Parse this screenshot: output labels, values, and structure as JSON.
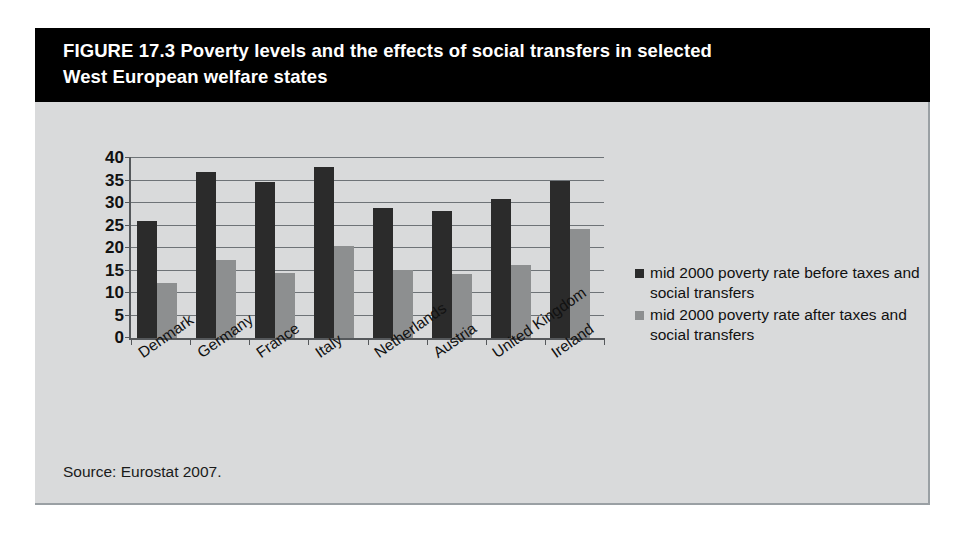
{
  "figure": {
    "title": "FIGURE 17.3  Poverty levels and the effects of social transfers in selected\nWest European welfare states",
    "source_note": "Source: Eurostat 2007.",
    "title_bg": "#000000",
    "title_color": "#ffffff",
    "panel_bg": "#d9dadb"
  },
  "chart_data": {
    "type": "bar",
    "title": "Poverty levels and the effects of social transfers in selected West European welfare states",
    "xlabel": "",
    "ylabel": "",
    "ylim": [
      0,
      40
    ],
    "ytick_values": [
      0,
      5,
      10,
      15,
      20,
      25,
      30,
      35,
      40
    ],
    "ytick_labels": [
      "0",
      "5",
      "10",
      "15",
      "20",
      "25",
      "30",
      "35",
      "40"
    ],
    "grid": true,
    "legend_position": "right",
    "categories": [
      "Denmark",
      "Germany",
      "France",
      "Italy",
      "Netherlands",
      "Austria",
      "United Kingdom",
      "Ireland"
    ],
    "series": [
      {
        "name": "mid 2000 poverty rate before taxes and social transfers",
        "color": "#2b2b2b",
        "values": [
          26.0,
          36.8,
          34.6,
          38.1,
          29.0,
          28.3,
          30.8,
          35.0
        ]
      },
      {
        "name": "mid 2000 poverty rate after taxes and social transfers",
        "color": "#8d8f90",
        "values": [
          12.3,
          17.4,
          14.5,
          20.4,
          15.2,
          14.3,
          16.3,
          24.3
        ]
      }
    ]
  }
}
